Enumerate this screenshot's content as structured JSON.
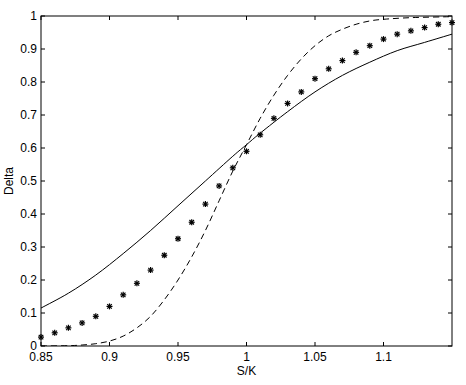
{
  "chart_data": {
    "type": "line",
    "title": "",
    "xlabel": "S/K",
    "ylabel": "Delta",
    "xlim": [
      0.85,
      1.15
    ],
    "ylim": [
      0,
      1
    ],
    "grid": false,
    "legend": null,
    "x_ticks": [
      0.85,
      0.9,
      0.95,
      1,
      1.05,
      1.1
    ],
    "x_tick_labels": [
      "0.85",
      "0.9",
      "0.95",
      "1",
      "1.05",
      "1.1"
    ],
    "y_ticks": [
      0,
      0.1,
      0.2,
      0.3,
      0.4,
      0.5,
      0.6,
      0.7,
      0.8,
      0.9,
      1
    ],
    "y_tick_labels": [
      "0",
      "0.1",
      "0.2",
      "0.3",
      "0.4",
      "0.5",
      "0.6",
      "0.7",
      "0.8",
      "0.9",
      "1"
    ],
    "series": [
      {
        "name": "solid",
        "style": "solid-line",
        "color": "#000000",
        "x": [
          0.85,
          0.87,
          0.89,
          0.91,
          0.93,
          0.95,
          0.97,
          0.99,
          1.0,
          1.01,
          1.03,
          1.05,
          1.07,
          1.09,
          1.11,
          1.13,
          1.15
        ],
        "values": [
          0.115,
          0.16,
          0.215,
          0.28,
          0.35,
          0.425,
          0.5,
          0.575,
          0.61,
          0.645,
          0.71,
          0.77,
          0.82,
          0.86,
          0.895,
          0.92,
          0.945
        ]
      },
      {
        "name": "dashed",
        "style": "dashed-line",
        "color": "#000000",
        "x": [
          0.85,
          0.87,
          0.88,
          0.89,
          0.9,
          0.91,
          0.92,
          0.93,
          0.94,
          0.95,
          0.96,
          0.97,
          0.98,
          0.99,
          1.0,
          1.01,
          1.02,
          1.03,
          1.04,
          1.05,
          1.06,
          1.07,
          1.08,
          1.09,
          1.1,
          1.12,
          1.15
        ],
        "values": [
          0.0,
          0.001,
          0.003,
          0.007,
          0.015,
          0.03,
          0.055,
          0.09,
          0.14,
          0.2,
          0.27,
          0.35,
          0.44,
          0.53,
          0.61,
          0.69,
          0.76,
          0.82,
          0.87,
          0.91,
          0.94,
          0.96,
          0.975,
          0.985,
          0.99,
          0.995,
          0.998
        ]
      },
      {
        "name": "markers",
        "style": "asterisk-markers",
        "color": "#000000",
        "x": [
          0.85,
          0.86,
          0.87,
          0.88,
          0.89,
          0.9,
          0.91,
          0.92,
          0.93,
          0.94,
          0.95,
          0.96,
          0.97,
          0.98,
          0.99,
          1.0,
          1.01,
          1.02,
          1.03,
          1.04,
          1.05,
          1.06,
          1.07,
          1.08,
          1.09,
          1.1,
          1.11,
          1.12,
          1.13,
          1.14,
          1.15
        ],
        "values": [
          0.027,
          0.04,
          0.055,
          0.07,
          0.09,
          0.12,
          0.155,
          0.19,
          0.23,
          0.275,
          0.325,
          0.375,
          0.43,
          0.485,
          0.54,
          0.59,
          0.64,
          0.69,
          0.735,
          0.77,
          0.81,
          0.84,
          0.865,
          0.89,
          0.91,
          0.93,
          0.945,
          0.955,
          0.965,
          0.975,
          0.98
        ]
      }
    ]
  }
}
